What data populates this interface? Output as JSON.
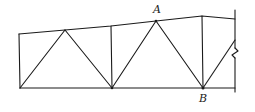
{
  "diagram": {
    "type": "truss",
    "labels": {
      "A": "A",
      "B": "B"
    },
    "colors": {
      "line": "#1a1a1a",
      "background": "#ffffff"
    },
    "nodes": {
      "TL": [
        19,
        34
      ],
      "BL": [
        20,
        88
      ],
      "T1": [
        65,
        30
      ],
      "T2": [
        111,
        26
      ],
      "BM": [
        112,
        88
      ],
      "A": [
        156,
        21
      ],
      "T3": [
        202,
        16
      ],
      "B": [
        203,
        88
      ],
      "TR": [
        235,
        19
      ],
      "WR": [
        235,
        40
      ]
    },
    "members": [
      [
        "TL",
        "T1"
      ],
      [
        "T1",
        "T2"
      ],
      [
        "T2",
        "A"
      ],
      [
        "A",
        "T3"
      ],
      [
        "T3",
        "TR"
      ],
      [
        "BL",
        "BM"
      ],
      [
        "BM",
        "B"
      ],
      [
        "TL",
        "BL"
      ],
      [
        "BL",
        "T1"
      ],
      [
        "T1",
        "BM"
      ],
      [
        "T2",
        "BM"
      ],
      [
        "BM",
        "A"
      ],
      [
        "A",
        "B"
      ],
      [
        "T3",
        "B"
      ],
      [
        "B",
        "WR"
      ]
    ]
  }
}
